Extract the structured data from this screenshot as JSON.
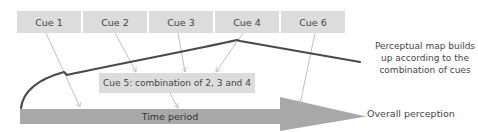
{
  "diagram": {
    "cues": [
      {
        "id": "cue-1",
        "label": "Cue 1"
      },
      {
        "id": "cue-2",
        "label": "Cue 2"
      },
      {
        "id": "cue-3",
        "label": "Cue 3"
      },
      {
        "id": "cue-4",
        "label": "Cue 4"
      },
      {
        "id": "cue-6",
        "label": "Cue 6"
      }
    ],
    "combined_cue": {
      "label": "Cue 5: combination of 2, 3 and 4"
    },
    "time_axis": {
      "label": "Time period"
    },
    "outcome": {
      "label": "Overall perception"
    },
    "annotation": {
      "line1": "Perceptual map builds",
      "line2": "up according to the",
      "line3": "combination of cues"
    },
    "colors": {
      "box": "#dcdcdc",
      "bar": "#a8a8a8",
      "curve": "#4a4a4a",
      "connector": "#b8b8b8",
      "text": "#444444"
    }
  }
}
